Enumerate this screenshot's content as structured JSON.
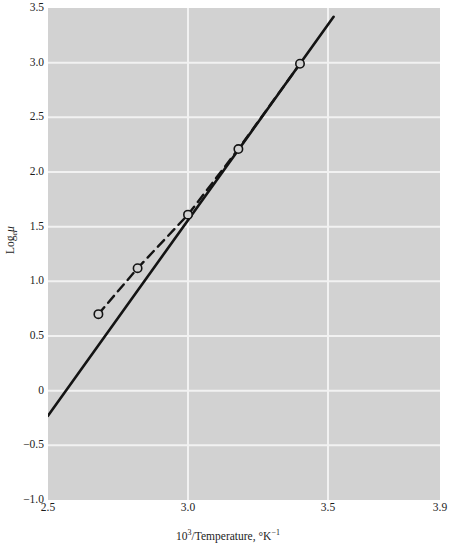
{
  "figure": {
    "background_color": "#ffffff",
    "plot_background_color": "#d2d2d2",
    "gridline_color": "#f2f2f2",
    "line_color": "#141414"
  },
  "axes": {
    "x_title_prefix": "10",
    "x_title_exponent": "3",
    "x_title_mid": "/Temperature, °K",
    "x_title_exponent2": "−1",
    "y_title_main": "Log",
    "y_title_sub": "e",
    "y_title_var": "μ"
  },
  "ticks": {
    "x": [
      {
        "label": "2.5",
        "value": 2.5
      },
      {
        "label": "3.0",
        "value": 3.0
      },
      {
        "label": "3.5",
        "value": 3.5
      },
      {
        "label": "3.9",
        "value": 3.9
      }
    ],
    "y": [
      {
        "label": "3.5",
        "value": 3.5
      },
      {
        "label": "3.0",
        "value": 3.0
      },
      {
        "label": "2.5",
        "value": 2.5
      },
      {
        "label": "2.0",
        "value": 2.0
      },
      {
        "label": "1.5",
        "value": 1.5
      },
      {
        "label": "1.0",
        "value": 1.0
      },
      {
        "label": "0.5",
        "value": 0.5
      },
      {
        "label": "0",
        "value": 0.0
      },
      {
        "label": "−0.5",
        "value": -0.5
      },
      {
        "label": "−1.0",
        "value": -1.0
      }
    ]
  },
  "chart_data": {
    "type": "line",
    "title": "",
    "xlabel": "10^3/Temperature, °K^-1",
    "ylabel": "Log_e μ",
    "xlim": [
      2.5,
      3.9
    ],
    "ylim": [
      -1.0,
      3.5
    ],
    "grid": true,
    "legend": "none",
    "xticks": [
      2.5,
      3.0,
      3.5,
      3.9
    ],
    "yticks": [
      3.5,
      3.0,
      2.5,
      2.0,
      1.5,
      1.0,
      0.5,
      0.0,
      -0.5,
      -1.0
    ],
    "series": [
      {
        "name": "fitted straight line",
        "style": "solid",
        "marker": "none",
        "x": [
          2.5,
          3.52
        ],
        "y": [
          -0.23,
          3.42
        ]
      },
      {
        "name": "measured data",
        "style": "dashed",
        "marker": "open-circle",
        "x": [
          2.68,
          2.82,
          3.0,
          3.18,
          3.4
        ],
        "y": [
          0.7,
          1.12,
          1.61,
          2.21,
          2.99
        ]
      }
    ],
    "points": [
      {
        "x": 2.68,
        "y": 0.7
      },
      {
        "x": 2.82,
        "y": 1.12
      },
      {
        "x": 3.0,
        "y": 1.61
      },
      {
        "x": 3.18,
        "y": 2.21
      },
      {
        "x": 3.4,
        "y": 2.99
      }
    ]
  }
}
